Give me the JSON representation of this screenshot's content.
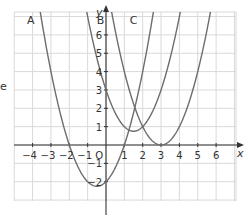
{
  "chart_data": {
    "type": "line",
    "title": "",
    "xlabel": "x",
    "ylabel": "y",
    "origin_label": "O",
    "xlim": [
      -5,
      7.1
    ],
    "ylim": [
      -3,
      7.2
    ],
    "grid": true,
    "x_ticks": [
      -4,
      -3,
      -2,
      -1,
      1,
      2,
      3,
      4,
      5,
      6
    ],
    "y_ticks": [
      -2,
      -1,
      1,
      2,
      3,
      4,
      5,
      6
    ],
    "series": [
      {
        "name": "A",
        "equation": "y = x^2 + x - 2",
        "a": 1,
        "h": -0.5,
        "k": -2.25,
        "label_pos": [
          -4.3,
          6.6
        ]
      },
      {
        "name": "B",
        "equation": "y = (x - 1.5)^2 + 0.75",
        "a": 1,
        "h": 1.5,
        "k": 0.75,
        "label_pos": [
          -0.5,
          6.6
        ]
      },
      {
        "name": "C",
        "equation": "y = (x - 3)^2",
        "a": 1,
        "h": 3,
        "k": 0,
        "label_pos": [
          1.3,
          6.6
        ]
      }
    ],
    "colors": {
      "curve": "#6d6d6d",
      "grid": "#d9d9d9",
      "axis": "#333333"
    }
  },
  "page": {
    "edge_fragment": "e"
  }
}
